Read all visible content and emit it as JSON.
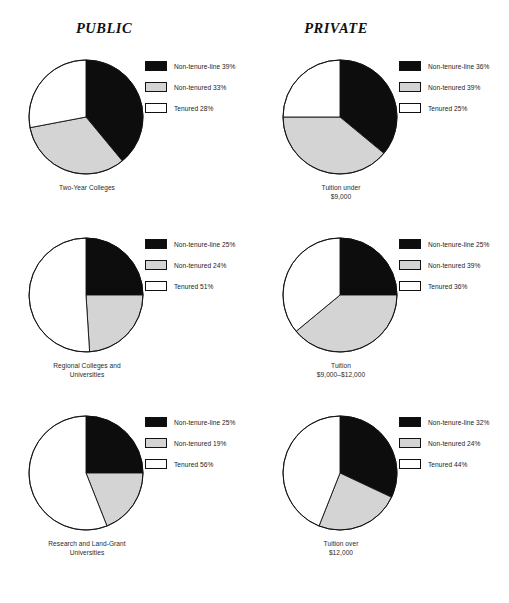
{
  "headings": {
    "left": "PUBLIC",
    "right": "PRIVATE"
  },
  "colors": {
    "non_tenure_line": "#0d0d0d",
    "non_tenured": "#d4d4d4",
    "tenured": "#ffffff",
    "outline": "#111111",
    "text": "#232323"
  },
  "chart_data": [
    {
      "type": "pie",
      "id": "public-two-year",
      "column": "PUBLIC",
      "title": "Two-Year Colleges",
      "caption_line1": "Two-Year Colleges",
      "caption_line2": "",
      "categories": [
        "Non-tenure-line",
        "Non-tenured",
        "Tenured"
      ],
      "values": [
        39,
        33,
        28
      ],
      "labels": [
        "Non-tenure-line 39%",
        "Non-tenured 33%",
        "Tenured 28%"
      ],
      "slice_colors": [
        "#0d0d0d",
        "#d4d4d4",
        "#ffffff"
      ],
      "start_angle": 0,
      "direction": "clockwise",
      "legend_position": "right"
    },
    {
      "type": "pie",
      "id": "private-tuition-under-9000",
      "column": "PRIVATE",
      "title": "Tuition under $9,000",
      "caption_line1": "Tuition under",
      "caption_line2": "$9,000",
      "categories": [
        "Non-tenure-line",
        "Non-tenured",
        "Tenured"
      ],
      "values": [
        36,
        39,
        25
      ],
      "labels": [
        "Non-tenure-line 36%",
        "Non-tenured 39%",
        "Tenured 25%"
      ],
      "slice_colors": [
        "#0d0d0d",
        "#d4d4d4",
        "#ffffff"
      ],
      "start_angle": 0,
      "direction": "clockwise",
      "legend_position": "right"
    },
    {
      "type": "pie",
      "id": "public-regional",
      "column": "PUBLIC",
      "title": "Regional Colleges and Universities",
      "caption_line1": "Regional Colleges and",
      "caption_line2": "Universities",
      "categories": [
        "Non-tenure-line",
        "Non-tenured",
        "Tenured"
      ],
      "values": [
        25,
        24,
        51
      ],
      "labels": [
        "Non-tenure-line 25%",
        "Non-tenured 24%",
        "Tenured 51%"
      ],
      "slice_colors": [
        "#0d0d0d",
        "#d4d4d4",
        "#ffffff"
      ],
      "start_angle": 0,
      "direction": "clockwise",
      "legend_position": "right"
    },
    {
      "type": "pie",
      "id": "private-tuition-9000-12000",
      "column": "PRIVATE",
      "title": "Tuition $9,000-$12,000",
      "caption_line1": "Tuition",
      "caption_line2": "$9,000–$12,000",
      "categories": [
        "Non-tenure-line",
        "Non-tenured",
        "Tenured"
      ],
      "values": [
        25,
        39,
        36
      ],
      "labels": [
        "Non-tenure-line 25%",
        "Non-tenured 39%",
        "Tenured 36%"
      ],
      "slice_colors": [
        "#0d0d0d",
        "#d4d4d4",
        "#ffffff"
      ],
      "start_angle": 0,
      "direction": "clockwise",
      "legend_position": "right"
    },
    {
      "type": "pie",
      "id": "public-research-land-grant",
      "column": "PUBLIC",
      "title": "Research and Land-Grant Universities",
      "caption_line1": "Research and Land-Grant",
      "caption_line2": "Universities",
      "categories": [
        "Non-tenure-line",
        "Non-tenured",
        "Tenured"
      ],
      "values": [
        25,
        19,
        56
      ],
      "labels": [
        "Non-tenure-line 25%",
        "Non-tenured 19%",
        "Tenured 56%"
      ],
      "slice_colors": [
        "#0d0d0d",
        "#d4d4d4",
        "#ffffff"
      ],
      "start_angle": 0,
      "direction": "clockwise",
      "legend_position": "right"
    },
    {
      "type": "pie",
      "id": "private-tuition-over-12000",
      "column": "PRIVATE",
      "title": "Tuition over $12,000",
      "caption_line1": "Tuition over",
      "caption_line2": "$12,000",
      "categories": [
        "Non-tenure-line",
        "Non-tenured",
        "Tenured"
      ],
      "values": [
        32,
        24,
        44
      ],
      "labels": [
        "Non-tenure-line 32%",
        "Non-tenured 24%",
        "Tenured 44%"
      ],
      "slice_colors": [
        "#0d0d0d",
        "#d4d4d4",
        "#ffffff"
      ],
      "start_angle": 0,
      "direction": "clockwise",
      "legend_position": "right"
    }
  ]
}
